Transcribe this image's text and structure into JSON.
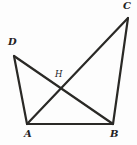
{
  "figure": {
    "kind": "geometry-diagram",
    "background_color": "#fdfdfd",
    "stroke_color": "#2a2926",
    "label_color": "#23221f",
    "width": 137,
    "height": 145
  },
  "points": {
    "A": {
      "label": "A",
      "x": 27,
      "y": 124,
      "label_x": 24,
      "label_y": 129
    },
    "B": {
      "label": "B",
      "x": 113,
      "y": 124,
      "label_x": 110,
      "label_y": 129
    },
    "C": {
      "label": "C",
      "x": 128,
      "y": 18,
      "label_x": 123,
      "label_y": 1
    },
    "D": {
      "label": "D",
      "x": 14,
      "y": 56,
      "label_x": 8,
      "label_y": 37
    },
    "H": {
      "label": "H",
      "x": 62,
      "y": 83,
      "label_x": 55,
      "label_y": 69
    }
  },
  "segments": [
    {
      "name": "segment-AB",
      "from": "A",
      "to": "B",
      "width": 2.2
    },
    {
      "name": "segment-AD",
      "from": "A",
      "to": "D",
      "width": 2.2
    },
    {
      "name": "segment-AC",
      "from": "A",
      "to": "C",
      "width": 2.2
    },
    {
      "name": "segment-DB",
      "from": "D",
      "to": "B",
      "width": 2.2
    },
    {
      "name": "segment-BC",
      "from": "B",
      "to": "C",
      "width": 2.2
    }
  ],
  "labels": {
    "A": "A",
    "B": "B",
    "C": "C",
    "D": "D",
    "H": "H"
  }
}
